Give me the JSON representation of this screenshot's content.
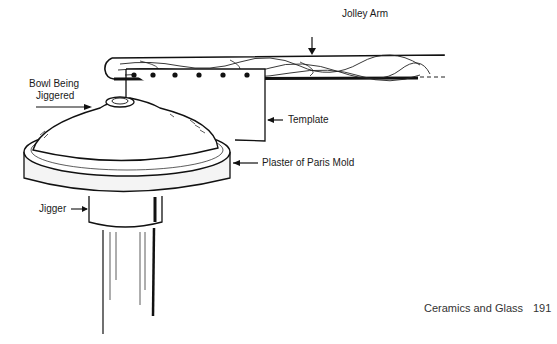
{
  "diagram": {
    "labels": {
      "jolley_arm": "Jolley Arm",
      "bowl_line1": "Bowl Being",
      "bowl_line2": "Jiggered",
      "template": "Template",
      "mold": "Plaster of Paris Mold",
      "jigger": "Jigger"
    }
  },
  "footer": {
    "section": "Ceramics and Glass",
    "page_number": "191"
  }
}
